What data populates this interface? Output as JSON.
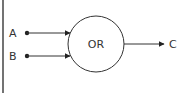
{
  "diagram": {
    "type": "logic-gate",
    "gate": {
      "label": "OR",
      "shape": "circle"
    },
    "inputs": [
      {
        "label": "A"
      },
      {
        "label": "B"
      }
    ],
    "output": {
      "label": "C"
    },
    "colors": {
      "stroke": "#333333",
      "background": "#ffffff"
    }
  }
}
